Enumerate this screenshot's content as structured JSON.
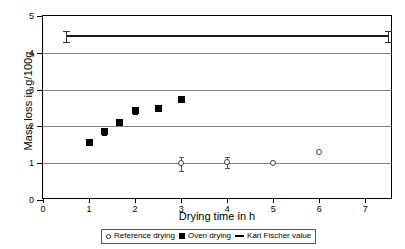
{
  "chart_data": {
    "type": "scatter",
    "title": "",
    "xlabel": "Drying time in h",
    "ylabel": "Mass loss in g/100g",
    "xlim": [
      0,
      7.6
    ],
    "ylim": [
      0,
      5
    ],
    "xticks": [
      "0",
      "1",
      "2",
      "3",
      "4",
      "5",
      "6",
      "7"
    ],
    "xtick_values": [
      0,
      1,
      2,
      3,
      4,
      5,
      6,
      7
    ],
    "yticks": [
      "0",
      "1",
      "2",
      "3",
      "4",
      "5"
    ],
    "ytick_values": [
      0,
      1,
      2,
      3,
      4,
      5
    ],
    "grid": "horizontal",
    "legend_position": "bottom",
    "series": [
      {
        "name": "Reference drying",
        "marker": "open-circle",
        "x": [
          3,
          4,
          5,
          6
        ],
        "y": [
          0.98,
          1.03,
          1.0,
          1.3
        ],
        "yerr": [
          0.2,
          0.15,
          0.0,
          0.0
        ]
      },
      {
        "name": "Oven drying",
        "marker": "filled-square",
        "x": [
          1,
          1.33,
          1.67,
          2,
          2.5,
          3
        ],
        "y": [
          1.57,
          1.85,
          2.1,
          2.44,
          2.5,
          2.72
        ],
        "yerr": [
          0.0,
          0.08,
          0.0,
          0.1,
          0.05,
          0.0
        ]
      },
      {
        "name": "Karl Fischer value",
        "marker": "line",
        "x": [
          0.5,
          7.5
        ],
        "y": [
          4.45,
          4.45
        ],
        "yerr": [
          0.15,
          0.15
        ]
      }
    ]
  },
  "legend": {
    "items": [
      {
        "label": "Reference drying",
        "marker": "open-circle"
      },
      {
        "label": "Oven drying",
        "marker": "filled-square"
      },
      {
        "label": "Karl Fischer value",
        "marker": "line"
      }
    ]
  }
}
